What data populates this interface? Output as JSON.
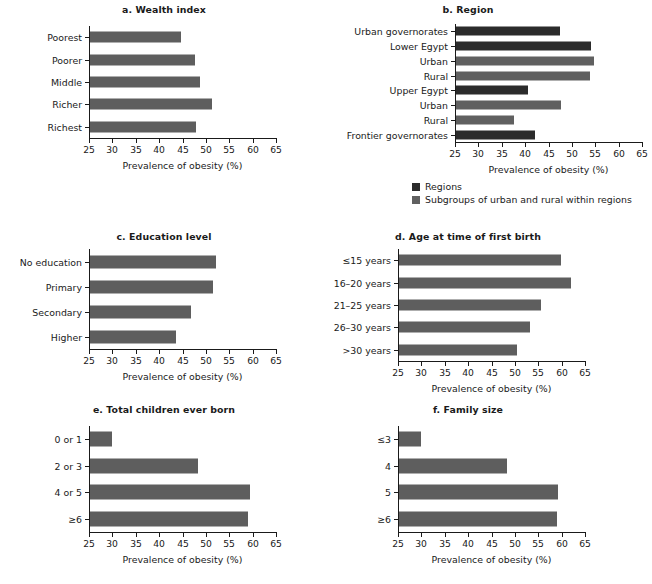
{
  "figure": {
    "axis_title": "Prevalence of obesity (%)",
    "x_ticks": [
      "25",
      "30",
      "35",
      "40",
      "45",
      "50",
      "55",
      "60",
      "65"
    ],
    "colors": {
      "regions": "#2b2b2b",
      "subgroups": "#606060",
      "bar_default": "#5e5e5e",
      "axis": "#1a1a1a"
    }
  },
  "legend": {
    "items": [
      {
        "label": "Regions",
        "color": "#2b2b2b",
        "key": "regions"
      },
      {
        "label": "Subgroups of urban and rural within regions",
        "color": "#606060",
        "key": "subgroups"
      }
    ]
  },
  "chart_data": [
    {
      "id": "a",
      "type": "bar",
      "orientation": "horizontal",
      "title": "a. Wealth index",
      "xlabel": "Prevalence of obesity (%)",
      "ylabel": "",
      "xlim": [
        25,
        65
      ],
      "xticks": [
        25,
        30,
        35,
        40,
        45,
        50,
        55,
        60,
        65
      ],
      "grid": false,
      "legend": "none",
      "categories": [
        "Poorest",
        "Poorer",
        "Middle",
        "Richer",
        "Richest"
      ],
      "values": [
        44.5,
        47.4,
        48.5,
        51.2,
        47.7
      ],
      "series_colors": [
        "#5e5e5e",
        "#5e5e5e",
        "#5e5e5e",
        "#5e5e5e",
        "#5e5e5e"
      ]
    },
    {
      "id": "b",
      "type": "bar",
      "orientation": "horizontal",
      "title": "b. Region",
      "xlabel": "Prevalence of obesity (%)",
      "ylabel": "",
      "xlim": [
        25,
        65
      ],
      "xticks": [
        25,
        30,
        35,
        40,
        45,
        50,
        55,
        60,
        65
      ],
      "grid": false,
      "legend": "below",
      "categories": [
        "Urban governorates",
        "Lower Egypt",
        "Urban",
        "Rural",
        "Upper Egypt",
        "Urban",
        "Rural",
        "Frontier governorates"
      ],
      "values": [
        47.2,
        53.8,
        54.5,
        53.6,
        40.4,
        47.4,
        37.3,
        41.9
      ],
      "series_colors": [
        "#2b2b2b",
        "#2b2b2b",
        "#606060",
        "#606060",
        "#2b2b2b",
        "#606060",
        "#606060",
        "#2b2b2b"
      ],
      "group_keys": [
        "regions",
        "regions",
        "subgroups",
        "subgroups",
        "regions",
        "subgroups",
        "subgroups",
        "regions"
      ]
    },
    {
      "id": "c",
      "type": "bar",
      "orientation": "horizontal",
      "title": "c. Education level",
      "xlabel": "Prevalence of obesity (%)",
      "ylabel": "",
      "xlim": [
        25,
        65
      ],
      "xticks": [
        25,
        30,
        35,
        40,
        45,
        50,
        55,
        60,
        65
      ],
      "grid": false,
      "legend": "none",
      "categories": [
        "No education",
        "Primary",
        "Secondary",
        "Higher"
      ],
      "values": [
        51.9,
        51.4,
        46.7,
        43.4
      ],
      "series_colors": [
        "#5e5e5e",
        "#5e5e5e",
        "#5e5e5e",
        "#5e5e5e"
      ]
    },
    {
      "id": "d",
      "type": "bar",
      "orientation": "horizontal",
      "title": "d. Age at time of first birth",
      "xlabel": "Prevalence of obesity (%)",
      "ylabel": "",
      "xlim": [
        25,
        65
      ],
      "xticks": [
        25,
        30,
        35,
        40,
        45,
        50,
        55,
        60,
        65
      ],
      "grid": false,
      "legend": "none",
      "categories": [
        "≤15 years",
        "16–20 years",
        "21–25 years",
        "26–30 years",
        ">30 years"
      ],
      "values": [
        59.7,
        61.8,
        55.3,
        53.0,
        50.2
      ],
      "series_colors": [
        "#5e5e5e",
        "#5e5e5e",
        "#5e5e5e",
        "#5e5e5e",
        "#5e5e5e"
      ]
    },
    {
      "id": "e",
      "type": "bar",
      "orientation": "horizontal",
      "title": "e. Total children ever born",
      "xlabel": "Prevalence of obesity (%)",
      "ylabel": "",
      "xlim": [
        25,
        65
      ],
      "xticks": [
        25,
        30,
        35,
        40,
        45,
        50,
        55,
        60,
        65
      ],
      "grid": false,
      "legend": "none",
      "categories": [
        "0 or 1",
        "2 or 3",
        "4 or 5",
        "≥6"
      ],
      "values": [
        29.7,
        48.0,
        59.2,
        58.8
      ],
      "series_colors": [
        "#5e5e5e",
        "#5e5e5e",
        "#5e5e5e",
        "#5e5e5e"
      ]
    },
    {
      "id": "f",
      "type": "bar",
      "orientation": "horizontal",
      "title": "f. Family size",
      "xlabel": "Prevalence of obesity (%)",
      "ylabel": "",
      "xlim": [
        25,
        65
      ],
      "xticks": [
        25,
        30,
        35,
        40,
        45,
        50,
        55,
        60,
        65
      ],
      "grid": false,
      "legend": "none",
      "categories": [
        "≤3",
        "4",
        "5",
        "≥6"
      ],
      "values": [
        29.7,
        48.0,
        59.1,
        58.7
      ],
      "series_colors": [
        "#5e5e5e",
        "#5e5e5e",
        "#5e5e5e",
        "#5e5e5e"
      ]
    }
  ]
}
